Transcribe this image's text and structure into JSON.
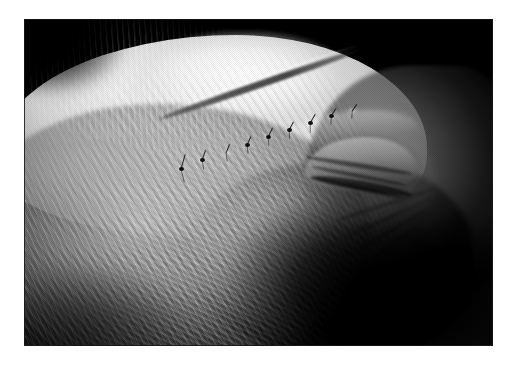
{
  "page": {
    "background_color": "#ffffff",
    "width": 518,
    "height": 366
  },
  "photograph": {
    "name": "clinical-photograph",
    "alt_text": "Close-up grayscale lateral photograph of an elderly person's head showing white hair, a closed eye with crow's-feet wrinkles, and a sutured surgical incision running diagonally across the temple and brow",
    "frame": {
      "x": 24,
      "y": 19,
      "width": 469,
      "height": 327
    },
    "color_mode": "grayscale",
    "palette": {
      "background_black": "#050505",
      "highlight_white": "#f2f2f2",
      "skin_midtone": "#9a9a9a",
      "shadow_gray": "#3a3a3a",
      "suture_dark": "#151515",
      "page_white": "#ffffff"
    },
    "subject": {
      "view": "lateral profile",
      "features": [
        "white gray hair",
        "closed eye",
        "eyelid creases",
        "crow's-feet wrinkles",
        "brow ridge",
        "temple",
        "cheek"
      ]
    },
    "wound": {
      "label": "sutured surgical incision",
      "suture_type": "interrupted",
      "stitch_count": 9,
      "orientation": "diagonal, ascending left to right"
    },
    "stitches": [
      {
        "x": 33.5,
        "y": 46.0,
        "angle": -74,
        "tail_a": 16,
        "tail_b": 13,
        "knot": true
      },
      {
        "x": 38.0,
        "y": 43.0,
        "angle": -70,
        "tail_a": 11,
        "tail_b": 9,
        "knot": true
      },
      {
        "x": 43.0,
        "y": 41.0,
        "angle": -68,
        "tail_a": 10,
        "tail_b": 8,
        "knot": false
      },
      {
        "x": 47.5,
        "y": 38.5,
        "angle": -66,
        "tail_a": 10,
        "tail_b": 8,
        "knot": true
      },
      {
        "x": 52.0,
        "y": 36.0,
        "angle": -64,
        "tail_a": 11,
        "tail_b": 8,
        "knot": true
      },
      {
        "x": 56.5,
        "y": 34.0,
        "angle": -62,
        "tail_a": 10,
        "tail_b": 8,
        "knot": true
      },
      {
        "x": 61.0,
        "y": 31.8,
        "angle": -60,
        "tail_a": 11,
        "tail_b": 9,
        "knot": true
      },
      {
        "x": 65.5,
        "y": 29.8,
        "angle": -58,
        "tail_a": 10,
        "tail_b": 8,
        "knot": true
      },
      {
        "x": 70.0,
        "y": 28.0,
        "angle": -56,
        "tail_a": 9,
        "tail_b": 7,
        "knot": false
      }
    ]
  }
}
